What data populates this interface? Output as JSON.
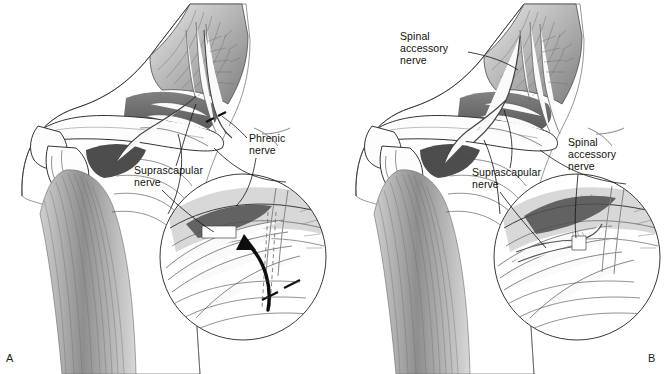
{
  "figure": {
    "type": "medical-illustration",
    "rendering": "grayscale pen-and-ink anatomical drawing",
    "background_color": "#ffffff",
    "ink_color": "#2b2b2b",
    "text_color": "#111111",
    "panel_count": 2
  },
  "panels": [
    {
      "id": "A",
      "letter": "A",
      "position": "left",
      "description": "Preoperative exposure showing the phrenic nerve and suprascapular nerve, with a curved arrow in the magnified inset indicating transfer direction and dashed lines marking the transection sites",
      "labels": [
        {
          "name": "phrenic-nerve",
          "lines": [
            "Phrenic",
            "nerve"
          ],
          "text": "Phrenic nerve"
        },
        {
          "name": "suprascapular-nerve",
          "lines": [
            "Suprascapular",
            "nerve"
          ],
          "text": "Suprascapular nerve"
        }
      ],
      "inset": {
        "name": "magnified-inset-a",
        "shape": "circle",
        "has_transfer_arrow": true,
        "has_cut_marks": true
      }
    },
    {
      "id": "B",
      "letter": "B",
      "position": "right",
      "description": "Completed spinal accessory nerve to suprascapular nerve transfer, with the coaptation shown in the magnified inset",
      "labels": [
        {
          "name": "spinal-accessory-nerve-upper",
          "lines": [
            "Spinal",
            "accessory",
            "nerve"
          ],
          "text": "Spinal accessory nerve"
        },
        {
          "name": "spinal-accessory-nerve-lower",
          "lines": [
            "Spinal",
            "accessory",
            "nerve"
          ],
          "text": "Spinal accessory nerve"
        },
        {
          "name": "suprascapular-nerve",
          "lines": [
            "Suprascapular",
            "nerve"
          ],
          "text": "Suprascapular nerve"
        }
      ],
      "inset": {
        "name": "magnified-inset-b",
        "shape": "circle",
        "has_transfer_arrow": false,
        "has_cut_marks": false
      }
    }
  ]
}
